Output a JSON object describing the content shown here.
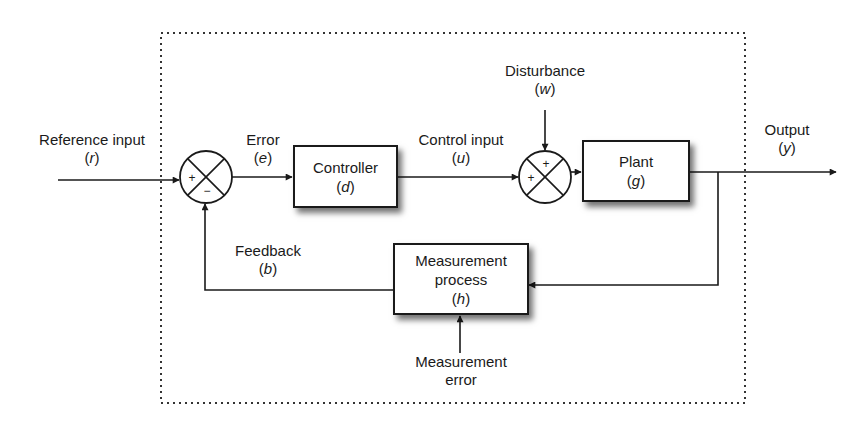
{
  "diagram": {
    "boundary": "dotted system boundary",
    "external_labels": {
      "reference_input": {
        "text": "Reference input",
        "symbol": "r"
      },
      "output": {
        "text": "Output",
        "symbol": "y"
      }
    },
    "signals": {
      "error": {
        "text": "Error",
        "symbol": "e"
      },
      "control_input": {
        "text": "Control input",
        "symbol": "u"
      },
      "disturbance": {
        "text": "Disturbance",
        "symbol": "w"
      },
      "feedback": {
        "text": "Feedback",
        "symbol": "b"
      },
      "measurement_error": {
        "line1": "Measurement",
        "line2": "error"
      }
    },
    "blocks": {
      "controller": {
        "text": "Controller",
        "symbol": "d"
      },
      "plant": {
        "text": "Plant",
        "symbol": "g"
      },
      "measurement": {
        "line1": "Measurement",
        "line2": "process",
        "symbol": "h"
      }
    },
    "junctions": {
      "error_junction": {
        "left_sign": "+",
        "bottom_sign": "−"
      },
      "disturbance_junction": {
        "left_sign": "+",
        "top_sign": "+"
      }
    },
    "paren_open": "(",
    "paren_close": ")"
  }
}
